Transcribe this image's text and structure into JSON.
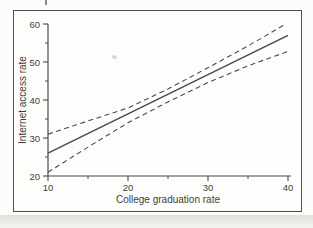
{
  "figure": {
    "frame_border_color": "#4f4f4f",
    "background_color": "#fdfdfb",
    "line_color": "#4a4a4a",
    "text_color": "#3d3d3d"
  },
  "chart_data": {
    "type": "line",
    "title": "",
    "xlabel": "College graduation rate",
    "ylabel": "Internet access rate",
    "xlim": [
      10,
      40
    ],
    "ylim": [
      20,
      60
    ],
    "x_major_ticks": [
      10,
      20,
      30,
      40
    ],
    "x_minor_ticks": [
      15,
      25,
      35
    ],
    "y_major_ticks": [
      20,
      30,
      40,
      50,
      60
    ],
    "y_minor_ticks": [
      25,
      35,
      45,
      55
    ],
    "grid": false,
    "legend_position": "none",
    "series": [
      {
        "name": "fitted-regression-line",
        "style": "solid",
        "points": [
          [
            10,
            26
          ],
          [
            40,
            57
          ]
        ]
      },
      {
        "name": "upper-confidence-band",
        "style": "dashed",
        "points": [
          [
            10,
            31
          ],
          [
            15,
            34.5
          ],
          [
            20,
            37.9
          ],
          [
            25,
            42.9
          ],
          [
            30,
            48.5
          ],
          [
            35,
            54.2
          ],
          [
            39.5,
            59.7
          ]
        ]
      },
      {
        "name": "lower-confidence-band",
        "style": "dashed",
        "points": [
          [
            10,
            21
          ],
          [
            15,
            27.6
          ],
          [
            20,
            34
          ],
          [
            25,
            39.5
          ],
          [
            30,
            44.6
          ],
          [
            35,
            49
          ],
          [
            40,
            52.8
          ]
        ]
      }
    ]
  }
}
